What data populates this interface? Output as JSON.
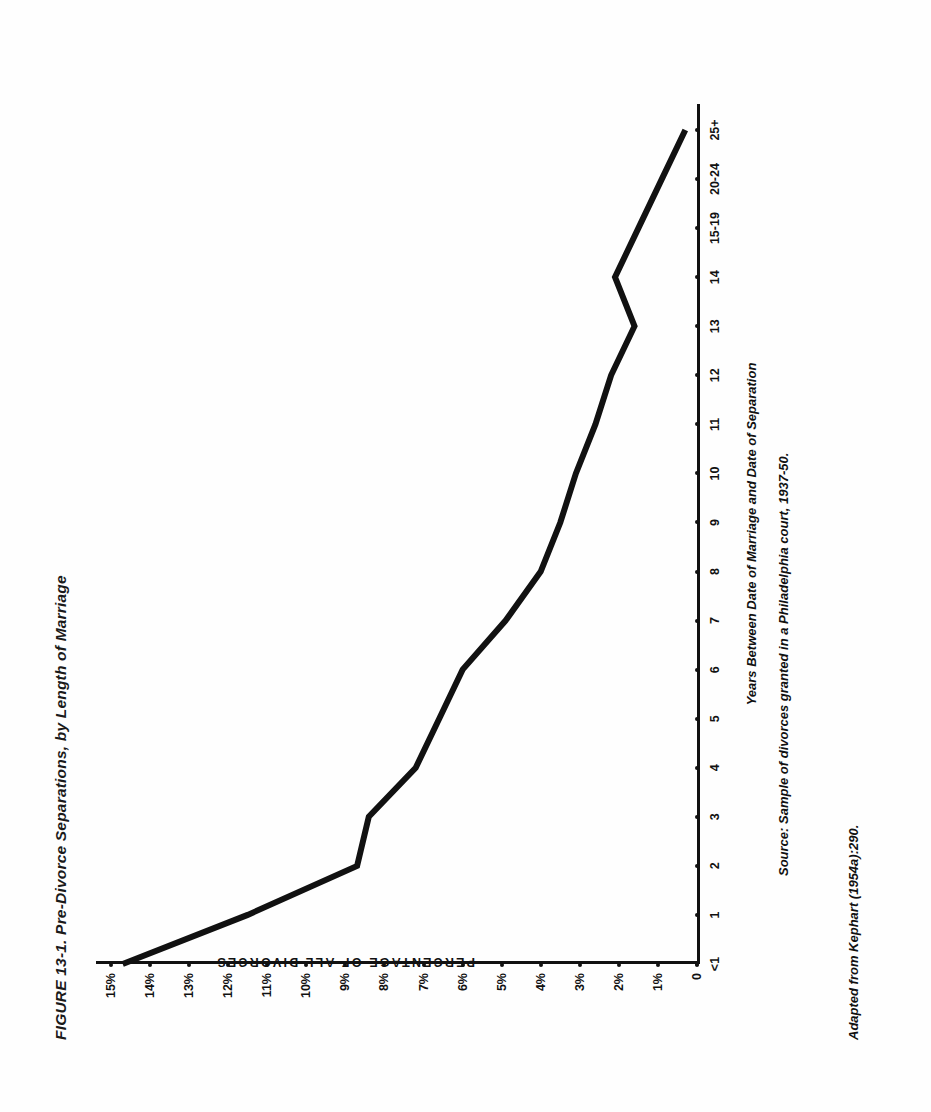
{
  "figure": {
    "number": "FIGURE 13-1.",
    "title": "Pre-Divorce Separations, by Length of Marriage",
    "full_title": "FIGURE 13-1.   Pre-Divorce Separations, by Length of Marriage",
    "source_note": "Source: Sample of divorces granted in a Philadelphia court, 1937-50.",
    "credit_note": "Adapted from Kephart (1954a):290.",
    "ink_color": "#111111",
    "page_color": "#ffffff"
  },
  "chart_data": {
    "type": "line",
    "title": "Pre-Divorce Separations, by Length of Marriage",
    "xlabel": "Years Between Date of Marriage and Date of Separation",
    "ylabel": "PERCENTAGE OF ALL DIVORCES",
    "categories": [
      "<1",
      "1",
      "2",
      "3",
      "4",
      "5",
      "6",
      "7",
      "8",
      "9",
      "10",
      "11",
      "12",
      "13",
      "14",
      "15-19",
      "20-24",
      "25+"
    ],
    "values": [
      14.7,
      11.5,
      8.7,
      8.4,
      7.2,
      6.6,
      6.0,
      4.9,
      4.0,
      3.5,
      3.1,
      2.6,
      2.2,
      1.6,
      2.1,
      1.5,
      0.9,
      0.3
    ],
    "ytick_labels": [
      "15%",
      "14%",
      "13%",
      "12%",
      "11%",
      "10%",
      "9%",
      "8%",
      "7%",
      "6%",
      "5%",
      "4%",
      "3%",
      "2%",
      "1%",
      "0"
    ],
    "ytick_values": [
      15,
      14,
      13,
      12,
      11,
      10,
      9,
      8,
      7,
      6,
      5,
      4,
      3,
      2,
      1,
      0
    ],
    "ylim": [
      0,
      15
    ],
    "grid": false,
    "legend": "none",
    "marker": "none",
    "line_width_px": 6
  }
}
